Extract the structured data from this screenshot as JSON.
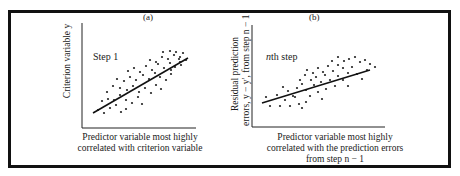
{
  "chart_data": [
    {
      "type": "scatter",
      "panel": "(a)",
      "annotation": "Step 1",
      "xlabel": "Predictor variable most highly correlated with criterion variable",
      "xlabel_lines": [
        "Predictor variable most highly",
        "correlated with criterion variable"
      ],
      "ylabel": "Criterion variable y",
      "axes": {
        "ticks": false,
        "grid": false
      },
      "regression_line": {
        "x1": 93,
        "y1": 113,
        "x2": 188,
        "y2": 58
      },
      "points": [
        [
          98,
          110
        ],
        [
          104,
          113
        ],
        [
          110,
          108
        ],
        [
          116,
          105
        ],
        [
          121,
          112
        ],
        [
          126,
          109
        ],
        [
          102,
          101
        ],
        [
          108,
          99
        ],
        [
          114,
          100
        ],
        [
          120,
          95
        ],
        [
          126,
          100
        ],
        [
          132,
          103
        ],
        [
          138,
          97
        ],
        [
          142,
          104
        ],
        [
          107,
          92
        ],
        [
          113,
          86
        ],
        [
          120,
          88
        ],
        [
          127,
          90
        ],
        [
          133,
          86
        ],
        [
          139,
          92
        ],
        [
          145,
          88
        ],
        [
          151,
          93
        ],
        [
          156,
          85
        ],
        [
          161,
          89
        ],
        [
          117,
          79
        ],
        [
          124,
          81
        ],
        [
          130,
          77
        ],
        [
          136,
          80
        ],
        [
          143,
          75
        ],
        [
          149,
          79
        ],
        [
          155,
          73
        ],
        [
          160,
          77
        ],
        [
          166,
          80
        ],
        [
          171,
          74
        ],
        [
          128,
          71
        ],
        [
          134,
          68
        ],
        [
          140,
          72
        ],
        [
          146,
          66
        ],
        [
          152,
          70
        ],
        [
          158,
          64
        ],
        [
          164,
          68
        ],
        [
          170,
          63
        ],
        [
          175,
          67
        ],
        [
          180,
          62
        ],
        [
          150,
          60
        ],
        [
          156,
          62
        ],
        [
          162,
          57
        ],
        [
          168,
          59
        ],
        [
          174,
          55
        ],
        [
          180,
          57
        ],
        [
          186,
          60
        ],
        [
          181,
          65
        ],
        [
          163,
          52
        ],
        [
          170,
          51
        ],
        [
          176,
          52
        ],
        [
          183,
          53
        ],
        [
          179,
          59
        ],
        [
          171,
          70
        ]
      ]
    },
    {
      "type": "scatter",
      "panel": "(b)",
      "annotation": "nth step",
      "xlabel": "Predictor variable most highly correlated with the prediction errors from step n − 1",
      "xlabel_lines": [
        "Predictor variable most highly",
        "correlated with the prediction errors",
        "from step n − 1"
      ],
      "ylabel": "Residual prediction errors, y − y′, from step n − 1",
      "ylabel_lines": [
        "Residual prediction",
        "errors, y − y′, from step n − 1"
      ],
      "axes": {
        "ticks": false,
        "grid": false
      },
      "regression_line": {
        "x1": 262,
        "y1": 103,
        "x2": 370,
        "y2": 70
      },
      "points": [
        [
          266,
          97
        ],
        [
          270,
          106
        ],
        [
          277,
          95
        ],
        [
          280,
          106
        ],
        [
          285,
          100
        ],
        [
          290,
          106
        ],
        [
          295,
          97
        ],
        [
          299,
          104
        ],
        [
          302,
          108
        ],
        [
          306,
          102
        ],
        [
          283,
          87
        ],
        [
          288,
          91
        ],
        [
          293,
          96
        ],
        [
          297,
          88
        ],
        [
          302,
          84
        ],
        [
          306,
          90
        ],
        [
          310,
          96
        ],
        [
          314,
          85
        ],
        [
          318,
          92
        ],
        [
          322,
          99
        ],
        [
          326,
          89
        ],
        [
          300,
          80
        ],
        [
          305,
          75
        ],
        [
          311,
          80
        ],
        [
          316,
          77
        ],
        [
          321,
          82
        ],
        [
          325,
          75
        ],
        [
          330,
          80
        ],
        [
          335,
          86
        ],
        [
          338,
          76
        ],
        [
          343,
          80
        ],
        [
          348,
          86
        ],
        [
          307,
          70
        ],
        [
          313,
          73
        ],
        [
          318,
          68
        ],
        [
          323,
          72
        ],
        [
          328,
          66
        ],
        [
          333,
          71
        ],
        [
          338,
          65
        ],
        [
          343,
          68
        ],
        [
          348,
          73
        ],
        [
          352,
          67
        ],
        [
          357,
          74
        ],
        [
          362,
          79
        ],
        [
          332,
          61
        ],
        [
          338,
          57
        ],
        [
          344,
          61
        ],
        [
          349,
          59
        ],
        [
          355,
          57
        ],
        [
          360,
          62
        ],
        [
          365,
          60
        ],
        [
          370,
          64
        ],
        [
          367,
          70
        ],
        [
          375,
          67
        ]
      ]
    }
  ],
  "panels": {
    "a": {
      "label": "(a)",
      "step": "Step 1",
      "ylabel": "Criterion variable y",
      "xlabel_line1": "Predictor variable most highly",
      "xlabel_line2": "correlated with criterion variable"
    },
    "b": {
      "label": "(b)",
      "step_var": "n",
      "step_rest": "th step",
      "ylabel_line1": "Residual prediction",
      "ylabel_line2": "errors, y − y′, from step n − 1",
      "xlabel_line1": "Predictor variable most highly",
      "xlabel_line2": "correlated with the prediction errors",
      "xlabel_line3": "from step n − 1"
    }
  }
}
